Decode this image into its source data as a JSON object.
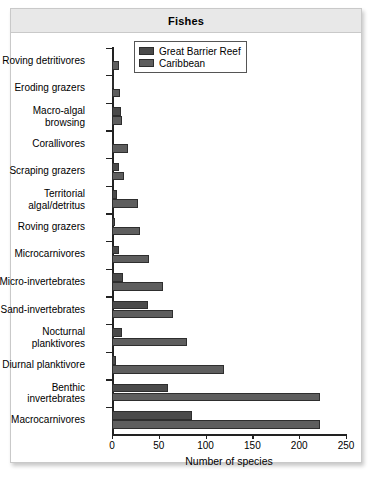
{
  "panel": {
    "title": "Fishes"
  },
  "chart_data": {
    "type": "bar",
    "orientation": "horizontal",
    "title": "Fishes",
    "xlabel": "Number of species",
    "ylabel": "",
    "xlim": [
      0,
      250
    ],
    "xticks": [
      0,
      50,
      100,
      150,
      200,
      250
    ],
    "grid": false,
    "legend_position": "top-right",
    "categories": [
      "Roving detritivores",
      "Eroding grazers",
      "Macro-algal\nbrowsing",
      "Corallivores",
      "Scraping grazers",
      "Territorial\nalgal/detritus",
      "Roving grazers",
      "Microcarnivores",
      "Micro-invertebrates",
      "Sand-invertebrates",
      "Nocturnal\nplanktivores",
      "Diurnal planktivore",
      "Benthic\ninvertebrates",
      "Macrocarnivores"
    ],
    "series": [
      {
        "name": "Great Barrier Reef",
        "color": "#4a4a4a",
        "values": [
          0,
          2,
          10,
          0,
          7,
          5,
          3,
          8,
          12,
          38,
          11,
          4,
          60,
          85
        ]
      },
      {
        "name": "Caribbean",
        "color": "#5e5e5e",
        "values": [
          7,
          9,
          11,
          17,
          13,
          28,
          30,
          40,
          55,
          65,
          80,
          120,
          222,
          222
        ]
      }
    ]
  },
  "legend": {
    "items": [
      {
        "label": "Great Barrier Reef",
        "swatch": "#4a4a4a"
      },
      {
        "label": "Caribbean",
        "swatch": "#5e5e5e"
      }
    ]
  }
}
